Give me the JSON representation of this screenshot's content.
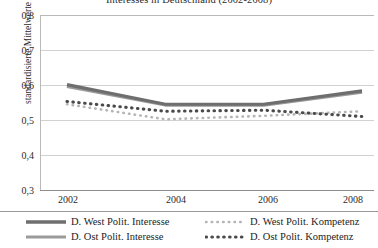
{
  "chart_data": {
    "type": "line",
    "title": "Interesses in Deutschland (2002-2008)",
    "xlabel": "",
    "ylabel": "standardisierte Mittelwerte",
    "x": [
      2002,
      2004,
      2006,
      2008
    ],
    "categories": [
      "2002",
      "2004",
      "2006",
      "2008"
    ],
    "xticklabels": [
      "2002",
      "2004",
      "2006",
      "2008"
    ],
    "yticklabels": [
      "0,8",
      "0,7",
      "0,6",
      "0,5",
      "0,4",
      "0,3"
    ],
    "ylim": [
      0.3,
      0.8
    ],
    "ytick_values": [
      0.8,
      0.7,
      0.6,
      0.5,
      0.4,
      0.3
    ],
    "xlim": [
      2002,
      2008
    ],
    "grid": "horizontal",
    "legend_position": "bottom",
    "series": [
      {
        "name": "D. West Polit. Interesse",
        "style": "solid-thick",
        "color": "#6e6e6e",
        "values": [
          0.601,
          0.545,
          0.545,
          0.583
        ]
      },
      {
        "name": "D. Ost Polit. Interesse",
        "style": "solid-thick",
        "color": "#9a9a9a",
        "values": [
          0.596,
          0.543,
          0.543,
          0.58
        ]
      },
      {
        "name": "D. West Polit. Kompetenz",
        "style": "dotted-light",
        "color": "#b5b5b5",
        "values": [
          0.545,
          0.502,
          0.512,
          0.525
        ]
      },
      {
        "name": "D. Ost Polit. Kompetenz",
        "style": "dotted-bold",
        "color": "#4a4a4a",
        "values": [
          0.553,
          0.525,
          0.528,
          0.51
        ]
      }
    ]
  },
  "legend": {
    "entries": [
      {
        "label": "D. West Polit. Interesse"
      },
      {
        "label": "D. Ost Polit. Interesse"
      },
      {
        "label": "D. West Polit. Kompetenz"
      },
      {
        "label": "D. Ost Polit. Kompetenz"
      }
    ]
  },
  "colors": {
    "west_interesse": "#6e6e6e",
    "ost_interesse": "#9a9a9a",
    "west_kompetenz": "#b5b5b5",
    "ost_kompetenz": "#4a4a4a",
    "gridline": "#d2d2d2",
    "axis": "#8d8d8d"
  }
}
